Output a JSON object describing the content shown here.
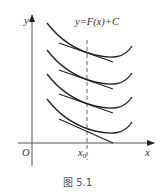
{
  "figure": {
    "equation_label": "y=F(x)+C",
    "y_axis_label": "y",
    "x_axis_label": "x",
    "origin_label": "O",
    "x0_label": "x",
    "x0_subscript": "0",
    "caption": "图 5.1"
  },
  "colors": {
    "stroke": "#222222",
    "axis": "#333333",
    "background": "#ffffff"
  },
  "curves": [
    {
      "name": "curve-1",
      "offset": 0
    },
    {
      "name": "curve-2",
      "offset": 27
    },
    {
      "name": "curve-3",
      "offset": 51
    },
    {
      "name": "curve-4",
      "offset": 76
    }
  ]
}
